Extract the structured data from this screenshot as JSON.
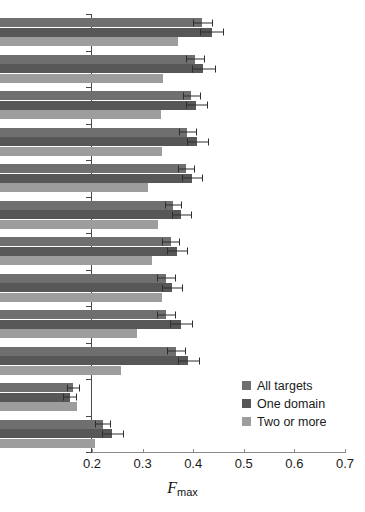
{
  "chart_data": {
    "type": "bar",
    "orientation": "horizontal",
    "title": "",
    "xlabel": "Fmax",
    "xlabel_parts": {
      "italic": "F",
      "subscript": "max"
    },
    "ylabel": "",
    "xlim": [
      0.2,
      0.7
    ],
    "xticks": [
      "0.2",
      "0.3",
      "0.4",
      "0.5",
      "0.6",
      "0.7"
    ],
    "xtick_values": [
      0.2,
      0.3,
      0.4,
      0.5,
      0.6,
      0.7
    ],
    "grid": false,
    "legend_position": "lower right",
    "categories": [
      "Jones-UCL",
      "GOstruct",
      "Argot2",
      "ConFunc",
      "PANNZER",
      "Tian Lab",
      "MS-kNN",
      "FASS",
      "ESG",
      "dcGO",
      "Naive",
      "BLAST"
    ],
    "series": [
      {
        "name": "All targets",
        "color": "#6f6f6f",
        "values": [
          0.6,
          0.585,
          0.578,
          0.57,
          0.568,
          0.542,
          0.537,
          0.528,
          0.528,
          0.548,
          0.345,
          0.403
        ],
        "errors": [
          0.019,
          0.018,
          0.017,
          0.017,
          0.016,
          0.016,
          0.016,
          0.017,
          0.017,
          0.017,
          0.012,
          0.015
        ]
      },
      {
        "name": "One domain",
        "color": "#575757",
        "values": [
          0.618,
          0.602,
          0.588,
          0.59,
          0.58,
          0.558,
          0.55,
          0.54,
          0.558,
          0.572,
          0.338,
          0.422
        ],
        "errors": [
          0.023,
          0.023,
          0.021,
          0.021,
          0.02,
          0.019,
          0.019,
          0.02,
          0.022,
          0.021,
          0.013,
          0.021
        ]
      },
      {
        "name": "Two or more",
        "color": "#9d9d9d",
        "values": [
          0.552,
          0.522,
          0.518,
          0.52,
          0.492,
          0.512,
          0.5,
          0.52,
          0.47,
          0.44,
          0.353,
          0.388
        ]
      }
    ]
  },
  "legend": {
    "items": [
      {
        "label": "All targets",
        "color": "#6f6f6f"
      },
      {
        "label": "One domain",
        "color": "#575757"
      },
      {
        "label": "Two or more",
        "color": "#9d9d9d"
      }
    ]
  }
}
